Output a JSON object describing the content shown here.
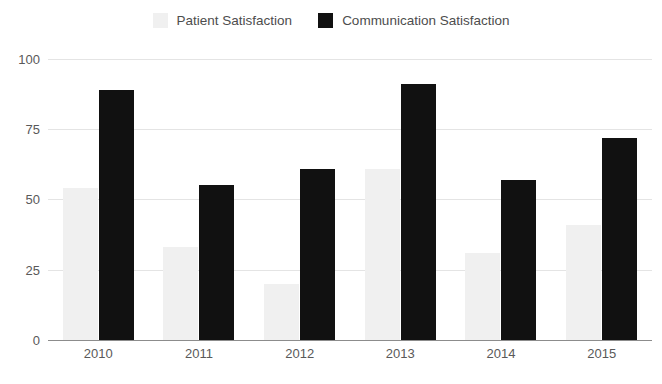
{
  "chart_data": {
    "type": "bar",
    "title": "",
    "subtitle": "",
    "xlabel": "",
    "ylabel": "",
    "categories": [
      "2010",
      "2011",
      "2012",
      "2013",
      "2014",
      "2015"
    ],
    "series": [
      {
        "name": "Patient Satisfaction",
        "color": "#f0f0f0",
        "values": [
          54,
          33,
          20,
          61,
          31,
          41
        ]
      },
      {
        "name": "Communication Satisfaction",
        "color": "#111111",
        "values": [
          89,
          55,
          61,
          91,
          57,
          72
        ]
      }
    ],
    "ylim": [
      0,
      100
    ],
    "yticks": [
      0,
      25,
      50,
      75,
      100
    ],
    "ytick_labels": [
      "0",
      "25",
      "50",
      "75",
      "100"
    ],
    "grid": true,
    "grid_axis": "y",
    "legend_position": "top-center",
    "background": "#ffffff",
    "gridline_color": "#e4e4e4",
    "axis_color": "#8c8c8c",
    "tick_label_color": "#595959",
    "legend_label_color": "#4d4d4d"
  }
}
